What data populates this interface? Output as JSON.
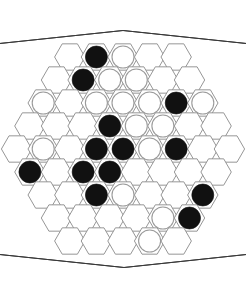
{
  "app": {
    "title": "Abalone Board",
    "board_type": "hexagonal-hex-grid",
    "side_length": 5,
    "rows": 9,
    "cell_counts": [
      5,
      6,
      7,
      8,
      9,
      8,
      7,
      6,
      5
    ],
    "total_cells": 61
  },
  "colors": {
    "background": "#ffffff",
    "board_face": "#ffffff",
    "cell_outline": "#8a8a8a",
    "board_outline": "#3a3a3a",
    "shadow_dark": "#0a0a0a",
    "edge_gray": "#c9c9c9",
    "stone_black": "#111111",
    "stone_white": "#ffffff",
    "stone_white_outline": "#9a9a9a"
  },
  "geometry": {
    "center_x": 123,
    "center_y": 149,
    "hex_radius": 15.2,
    "row_step": 23.0,
    "col_step": 26.6,
    "stone_radius": 11.0,
    "outline_apex_top_x": 123,
    "outline_apex_top_y": 20,
    "outline_apex_bottom_x": 124,
    "outline_apex_bottom_y": 278,
    "outline_left_x": 16,
    "outline_right_x": 231
  },
  "legend": {
    "black_label": "Black marble",
    "white_label": "White marble",
    "empty_label": "Empty space"
  },
  "counts": {
    "black": 17,
    "white": 13,
    "empty": 31
  },
  "board": {
    "rows": [
      {
        "id": "row-1",
        "count": 5,
        "cells": [
          "empty",
          "black",
          "white",
          "empty",
          "empty"
        ]
      },
      {
        "id": "row-2",
        "count": 6,
        "cells": [
          "empty",
          "black",
          "white",
          "white",
          "empty",
          "empty"
        ]
      },
      {
        "id": "row-3",
        "count": 7,
        "cells": [
          "white",
          "empty",
          "white",
          "white",
          "white",
          "black",
          "white"
        ]
      },
      {
        "id": "row-4",
        "count": 8,
        "cells": [
          "empty",
          "empty",
          "empty",
          "black",
          "white",
          "white",
          "empty",
          "empty"
        ]
      },
      {
        "id": "row-5",
        "count": 9,
        "cells": [
          "empty",
          "white",
          "empty",
          "black",
          "black",
          "white",
          "black",
          "empty",
          "empty"
        ]
      },
      {
        "id": "row-6",
        "count": 8,
        "cells": [
          "black",
          "empty",
          "black",
          "black",
          "empty",
          "empty",
          "empty",
          "empty"
        ]
      },
      {
        "id": "row-7",
        "count": 7,
        "cells": [
          "empty",
          "empty",
          "black",
          "white",
          "empty",
          "empty",
          "black"
        ]
      },
      {
        "id": "row-8",
        "count": 6,
        "cells": [
          "empty",
          "empty",
          "empty",
          "empty",
          "white",
          "black"
        ]
      },
      {
        "id": "row-9",
        "count": 5,
        "cells": [
          "empty",
          "empty",
          "empty",
          "white",
          "empty"
        ]
      }
    ]
  }
}
